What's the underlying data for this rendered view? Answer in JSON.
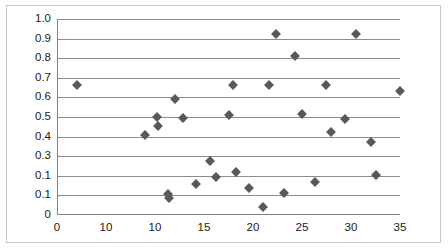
{
  "chart_data": {
    "type": "scatter",
    "title": "",
    "xlabel": "",
    "ylabel": "",
    "xlim": [
      0,
      35
    ],
    "ylim": [
      0,
      1.0
    ],
    "grid": "horizontal",
    "legend": "none",
    "marker_shape": "diamond",
    "marker_color": "#595959",
    "axis_color": "#808080",
    "gridline_color": "#8c8c8c",
    "border_color": "#c8c8c8",
    "y_ticks": [
      {
        "value": 1.0,
        "label": "1.0"
      },
      {
        "value": 0.9,
        "label": "0.9"
      },
      {
        "value": 0.8,
        "label": "0.8"
      },
      {
        "value": 0.7,
        "label": "0.7"
      },
      {
        "value": 0.6,
        "label": "0.6"
      },
      {
        "value": 0.5,
        "label": "0.5"
      },
      {
        "value": 0.4,
        "label": "0.4"
      },
      {
        "value": 0.3,
        "label": "0.3"
      },
      {
        "value": 0.2,
        "label": "0.1"
      },
      {
        "value": 0.1,
        "label": "0.1"
      },
      {
        "value": 0.0,
        "label": "0"
      }
    ],
    "x_ticks": [
      {
        "value": 0,
        "label": "0"
      },
      {
        "value": 5,
        "label": "10"
      },
      {
        "value": 10,
        "label": "10"
      },
      {
        "value": 15,
        "label": "15"
      },
      {
        "value": 20,
        "label": "20"
      },
      {
        "value": 25,
        "label": "25"
      },
      {
        "value": 30,
        "label": "30"
      },
      {
        "value": 35,
        "label": "35"
      }
    ],
    "points": [
      {
        "x": 2.0,
        "y": 0.665
      },
      {
        "x": 9.0,
        "y": 0.41
      },
      {
        "x": 10.2,
        "y": 0.5
      },
      {
        "x": 10.3,
        "y": 0.455
      },
      {
        "x": 11.3,
        "y": 0.108
      },
      {
        "x": 11.4,
        "y": 0.088
      },
      {
        "x": 12.0,
        "y": 0.59
      },
      {
        "x": 12.9,
        "y": 0.495
      },
      {
        "x": 14.2,
        "y": 0.158
      },
      {
        "x": 15.6,
        "y": 0.275
      },
      {
        "x": 16.2,
        "y": 0.195
      },
      {
        "x": 17.5,
        "y": 0.51
      },
      {
        "x": 18.0,
        "y": 0.665
      },
      {
        "x": 18.3,
        "y": 0.218
      },
      {
        "x": 19.6,
        "y": 0.14
      },
      {
        "x": 21.0,
        "y": 0.04
      },
      {
        "x": 21.6,
        "y": 0.665
      },
      {
        "x": 22.3,
        "y": 0.925
      },
      {
        "x": 23.2,
        "y": 0.112
      },
      {
        "x": 24.3,
        "y": 0.81
      },
      {
        "x": 25.0,
        "y": 0.515
      },
      {
        "x": 26.3,
        "y": 0.17
      },
      {
        "x": 27.4,
        "y": 0.665
      },
      {
        "x": 28.0,
        "y": 0.425
      },
      {
        "x": 29.4,
        "y": 0.49
      },
      {
        "x": 30.5,
        "y": 0.925
      },
      {
        "x": 32.0,
        "y": 0.375
      },
      {
        "x": 32.6,
        "y": 0.205
      },
      {
        "x": 35.0,
        "y": 0.635
      }
    ]
  }
}
